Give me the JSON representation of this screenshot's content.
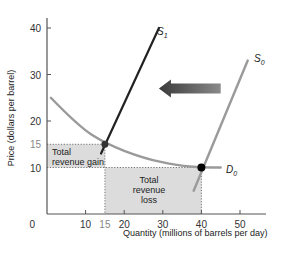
{
  "chart_data": {
    "type": "line",
    "title": "",
    "xlabel": "Quantity (millions of barrels per day)",
    "ylabel": "Price (dollars per barrel)",
    "xlim": [
      0,
      55
    ],
    "ylim": [
      0,
      42
    ],
    "x_ticks": [
      0,
      10,
      15,
      20,
      30,
      40,
      50
    ],
    "y_ticks": [
      10,
      15,
      20,
      30,
      40
    ],
    "origin_label": "0",
    "grid": false,
    "series": [
      {
        "name": "S1",
        "label": "S",
        "subscript": "1",
        "kind": "supply",
        "color": "#222222",
        "points": [
          [
            14,
            13
          ],
          [
            29,
            40
          ]
        ]
      },
      {
        "name": "S0",
        "label": "S",
        "subscript": "0",
        "kind": "supply",
        "color": "#9a9a9a",
        "points": [
          [
            38,
            5
          ],
          [
            52,
            33
          ]
        ]
      },
      {
        "name": "D0",
        "label": "D",
        "subscript": "0",
        "kind": "demand",
        "color": "#9a9a9a",
        "points": [
          [
            1,
            25
          ],
          [
            8,
            19
          ],
          [
            15,
            15.2
          ],
          [
            25,
            12
          ],
          [
            34,
            10.4
          ],
          [
            40,
            10
          ],
          [
            45,
            10
          ]
        ]
      }
    ],
    "equilibria": [
      {
        "name": "new",
        "x": 15,
        "y": 15
      },
      {
        "name": "original",
        "x": 40,
        "y": 10
      }
    ],
    "areas": [
      {
        "name": "total-revenue-gain",
        "label_lines": [
          "Total",
          "revenue gain"
        ],
        "x": [
          0,
          15
        ],
        "y": [
          10,
          15
        ],
        "color": "#dcdcdc"
      },
      {
        "name": "total-revenue-loss",
        "label_lines": [
          "Total",
          "revenue",
          "loss"
        ],
        "x": [
          15,
          40
        ],
        "y": [
          0,
          10
        ],
        "color": "#dcdcdc"
      }
    ],
    "annotations": [
      {
        "type": "arrow",
        "direction": "left",
        "from": [
          45,
          27
        ],
        "to": [
          29,
          27
        ],
        "meaning": "supply decrease shift"
      }
    ]
  }
}
